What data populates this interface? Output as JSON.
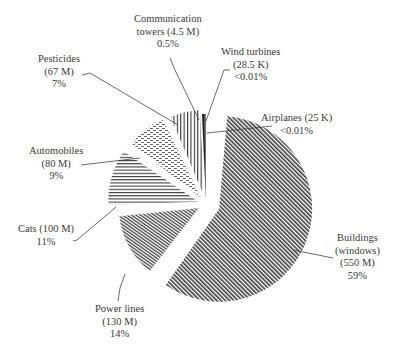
{
  "chart_data": {
    "type": "pie",
    "title": "",
    "exploded": true,
    "units": "number of bird deaths",
    "slices": [
      {
        "key": "buildings",
        "label": [
          "Buildings",
          "(windows)",
          "(550 M)",
          "59%"
        ],
        "name": "Buildings (windows)",
        "value_text": "550 M",
        "value": 550000000,
        "percent": 59,
        "pattern": "dense-diagonal"
      },
      {
        "key": "powerlines",
        "label": [
          "Power lines",
          "(130 M)",
          "14%"
        ],
        "name": "Power lines",
        "value_text": "130 M",
        "value": 130000000,
        "percent": 14,
        "pattern": "fine-diagonal"
      },
      {
        "key": "cats",
        "label": [
          "Cats (100 M)",
          "11%"
        ],
        "name": "Cats",
        "value_text": "100 M",
        "value": 100000000,
        "percent": 11,
        "pattern": "horizontal-lines"
      },
      {
        "key": "automobiles",
        "label": [
          "Automobiles",
          "(80 M)",
          "9%"
        ],
        "name": "Automobiles",
        "value_text": "80 M",
        "value": 80000000,
        "percent": 9,
        "pattern": "dashes"
      },
      {
        "key": "pesticides",
        "label": [
          "Pesticides",
          "(67 M)",
          "7%"
        ],
        "name": "Pesticides",
        "value_text": "67 M",
        "value": 67000000,
        "percent": 7,
        "pattern": "vertical-lines"
      },
      {
        "key": "comm",
        "label": [
          "Communication",
          "towers (4.5 M)",
          "0.5%"
        ],
        "name": "Communication towers",
        "value_text": "4.5 M",
        "value": 4500000,
        "percent": 0.5,
        "pattern": "solid-dark"
      },
      {
        "key": "wind",
        "label": [
          "Wind turbines",
          "(28.5 K)",
          "<0.01%"
        ],
        "name": "Wind turbines",
        "value_text": "28.5 K",
        "value": 28500,
        "percent": "<0.01",
        "pattern": "solid"
      },
      {
        "key": "airplanes",
        "label": [
          "Airplanes (25 K)",
          "<0.01%"
        ],
        "name": "Airplanes",
        "value_text": "25 K",
        "value": 25000,
        "percent": "<0.01",
        "pattern": "solid"
      }
    ],
    "legend": "none (direct labels with leader lines)"
  },
  "labels": {
    "comm": [
      "Communication",
      "towers (4.5 M)",
      "0.5%"
    ],
    "wind": [
      "Wind turbines",
      "(28.5 K)",
      "<0.01%"
    ],
    "pesticides": [
      "Pesticides",
      "(67 M)",
      "7%"
    ],
    "airplanes": [
      "Airplanes (25 K)",
      "<0.01%"
    ],
    "automobiles": [
      "Automobiles",
      "(80 M)",
      "9%"
    ],
    "cats": [
      "Cats (100 M)",
      "11%"
    ],
    "buildings": [
      "Buildings",
      "(windows)",
      "(550 M)",
      "59%"
    ],
    "powerlines": [
      "Power lines",
      "(130 M)",
      "14%"
    ]
  }
}
